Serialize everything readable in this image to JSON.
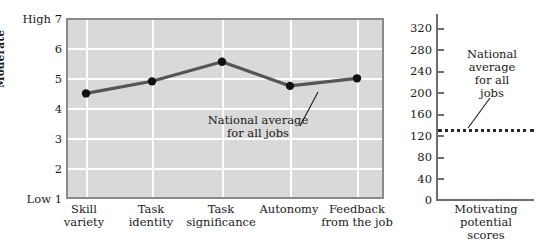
{
  "chart_data": [
    {
      "id": "job-characteristics",
      "type": "line",
      "title": "",
      "xlabel": "",
      "ylabel": "Moderate",
      "categories": [
        "Skill variety",
        "Task identity",
        "Task significance",
        "Autonomy",
        "Feedback from the job"
      ],
      "category_lines": [
        [
          "Skill",
          "variety"
        ],
        [
          "Task",
          "identity"
        ],
        [
          "Task",
          "significance"
        ],
        [
          "Autonomy",
          ""
        ],
        [
          "Feedback",
          "from the job"
        ]
      ],
      "values": [
        4.5,
        4.9,
        5.55,
        4.75,
        5.0
      ],
      "ylim": [
        1,
        7
      ],
      "yticks": [
        7,
        6,
        5,
        4,
        3,
        2,
        1
      ],
      "ytick_labels": [
        "High 7",
        "6",
        "5",
        "4",
        "3",
        "2",
        "Low 1"
      ],
      "grid": true,
      "legend": "none",
      "annotations": [
        {
          "text_lines": [
            "National average",
            "for all jobs"
          ],
          "target_category": "Feedback from the job"
        }
      ],
      "series_color": "#555555",
      "marker_color": "#111111",
      "plot_bg": "#d9d9d9",
      "gridline_color": "#ffffff"
    },
    {
      "id": "motivating-potential-scores",
      "type": "line",
      "title": "",
      "xlabel": "Motivating potential scores",
      "xlabel_lines": [
        "Motivating",
        "potential",
        "scores"
      ],
      "ylabel": "",
      "ylim": [
        0,
        340
      ],
      "yticks": [
        320,
        280,
        240,
        200,
        160,
        120,
        80,
        40,
        0
      ],
      "ytick_labels": [
        "320",
        "280",
        "240",
        "200",
        "160",
        "120",
        "80",
        "40",
        "0"
      ],
      "reference_line": {
        "value": 131,
        "style": "dotted",
        "color": "#2a2a2a"
      },
      "grid": false,
      "legend": "none",
      "annotations": [
        {
          "text_lines": [
            "National",
            "average",
            "for all",
            "jobs"
          ],
          "target_value": 131
        }
      ],
      "axis_color": "#6e6e6e"
    }
  ],
  "colors": {
    "page_background": "#ffffff",
    "plot_background": "#d9d9d9",
    "gridline": "#ffffff",
    "line": "#555555",
    "marker": "#111111",
    "axis": "#6e6e6e",
    "text": "#1a1a1a",
    "reference_line": "#2a2a2a"
  }
}
